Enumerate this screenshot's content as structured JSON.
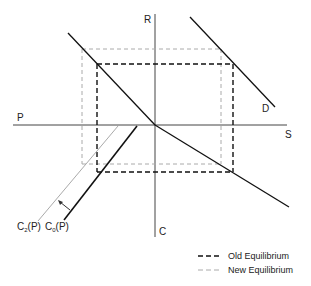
{
  "diagram": {
    "axes": {
      "top": "R",
      "bottom": "C",
      "left": "P",
      "right": "S"
    },
    "curves": {
      "demand": "D",
      "c0": {
        "main": "C",
        "sub": "0",
        "arg": "(P)"
      },
      "c2": {
        "main": "C",
        "sub": "2",
        "arg": "(P)"
      }
    },
    "legend": {
      "old": "Old Equilibrium",
      "new": "New Equilibrium"
    },
    "colors": {
      "old": "#111111",
      "new": "#aaaaaa",
      "axis": "#444444"
    }
  }
}
